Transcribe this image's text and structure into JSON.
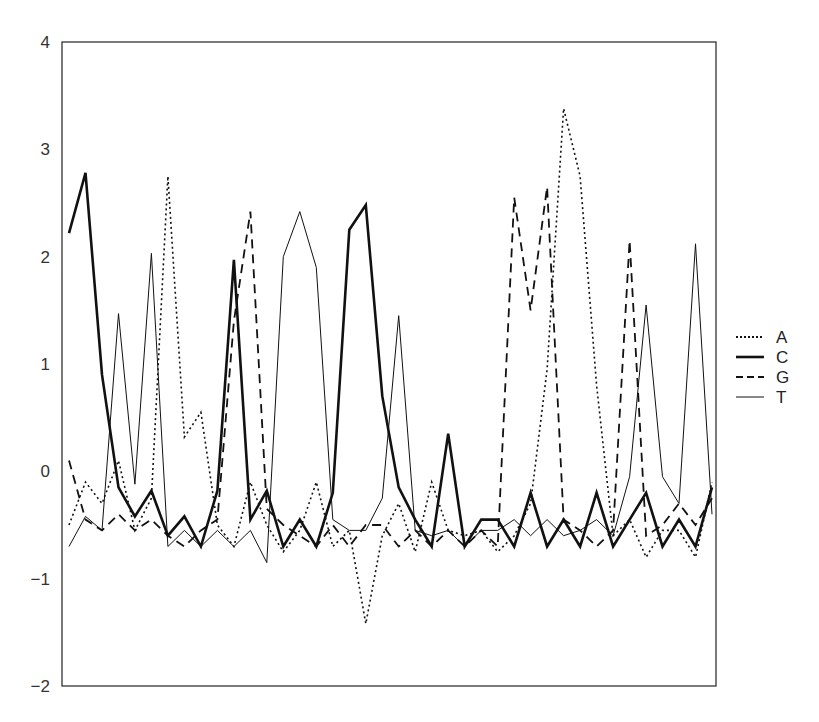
{
  "chart_data": {
    "type": "line",
    "title": "",
    "xlabel": "",
    "ylabel": "",
    "ylim": [
      -2,
      4
    ],
    "yticks": [
      -2,
      -1,
      0,
      1,
      2,
      3,
      4
    ],
    "ytick_labels": [
      "−2",
      "−1",
      "0",
      "1",
      "2",
      "3",
      "4"
    ],
    "xticks": [],
    "grid": false,
    "legend_position": "right",
    "n_points": 40,
    "x": [
      1,
      2,
      3,
      4,
      5,
      6,
      7,
      8,
      9,
      10,
      11,
      12,
      13,
      14,
      15,
      16,
      17,
      18,
      19,
      20,
      21,
      22,
      23,
      24,
      25,
      26,
      27,
      28,
      29,
      30,
      31,
      32,
      33,
      34,
      35,
      36,
      37,
      38,
      39,
      40
    ],
    "series": [
      {
        "name": "A",
        "style": "dotted",
        "width": 1.6,
        "values": [
          -0.5,
          -0.1,
          -0.3,
          0.1,
          -0.55,
          -0.25,
          2.75,
          0.32,
          0.55,
          -0.5,
          -0.7,
          -0.1,
          -0.5,
          -0.75,
          -0.55,
          -0.1,
          -0.7,
          -0.55,
          -1.42,
          -0.6,
          -0.3,
          -0.75,
          -0.1,
          -0.55,
          -0.6,
          -0.55,
          -0.75,
          -0.6,
          -0.3,
          0.95,
          3.38,
          2.75,
          0.8,
          -0.6,
          -0.45,
          -0.8,
          -0.55,
          -0.55,
          -0.8,
          -0.1
        ]
      },
      {
        "name": "C",
        "style": "solid",
        "width": 2.6,
        "values": [
          2.22,
          2.78,
          0.9,
          -0.15,
          -0.42,
          -0.18,
          -0.6,
          -0.42,
          -0.7,
          -0.18,
          1.97,
          -0.45,
          -0.18,
          -0.7,
          -0.45,
          -0.7,
          -0.2,
          2.25,
          2.48,
          0.7,
          -0.15,
          -0.45,
          -0.7,
          0.35,
          -0.7,
          -0.45,
          -0.45,
          -0.7,
          -0.2,
          -0.7,
          -0.45,
          -0.7,
          -0.2,
          -0.7,
          -0.45,
          -0.2,
          -0.7,
          -0.45,
          -0.7,
          -0.15
        ]
      },
      {
        "name": "G",
        "style": "dashed",
        "width": 1.8,
        "values": [
          0.1,
          -0.45,
          -0.55,
          -0.4,
          -0.55,
          -0.45,
          -0.6,
          -0.7,
          -0.55,
          -0.45,
          1.4,
          2.42,
          -0.35,
          -0.5,
          -0.6,
          -0.7,
          -0.5,
          -0.7,
          -0.5,
          -0.5,
          -0.7,
          -0.55,
          -0.7,
          -0.55,
          -0.7,
          -0.55,
          -0.7,
          2.55,
          1.5,
          2.65,
          -0.45,
          -0.55,
          -0.7,
          -0.55,
          2.15,
          -0.6,
          -0.5,
          -0.3,
          -0.5,
          -0.25
        ]
      },
      {
        "name": "T",
        "style": "solid",
        "width": 1.0,
        "values": [
          -0.7,
          -0.42,
          -0.55,
          1.47,
          -0.12,
          2.03,
          -0.7,
          -0.55,
          -0.7,
          -0.55,
          -0.7,
          -0.55,
          -0.85,
          2.0,
          2.42,
          1.9,
          -0.45,
          -0.55,
          -0.55,
          -0.25,
          1.45,
          -0.55,
          -0.6,
          -0.55,
          -0.7,
          -0.55,
          -0.55,
          -0.45,
          -0.6,
          -0.45,
          -0.6,
          -0.55,
          -0.45,
          -0.6,
          -0.05,
          1.55,
          -0.05,
          -0.3,
          2.12,
          -0.4
        ]
      }
    ],
    "legend": [
      {
        "label": "A",
        "style": "dotted"
      },
      {
        "label": "C",
        "style": "solid-thick"
      },
      {
        "label": "G",
        "style": "dashed"
      },
      {
        "label": "T",
        "style": "solid-thin"
      }
    ],
    "colors": {
      "line": "#111111",
      "axis": "#333333",
      "background": "#ffffff"
    }
  }
}
